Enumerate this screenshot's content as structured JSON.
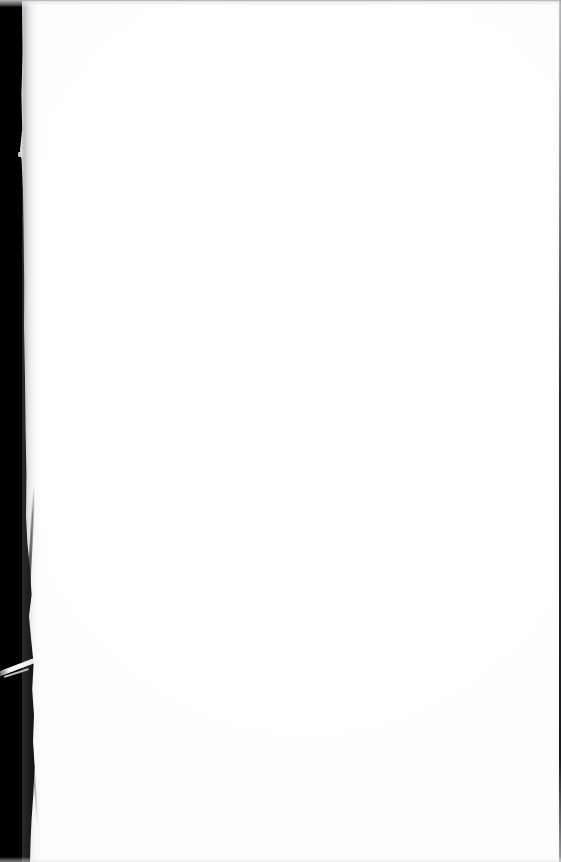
{
  "document": {
    "kind": "scanned-page-image",
    "page_condition": "blank",
    "visible_text": "",
    "body_text_lines": [],
    "page_number_label": "",
    "header_text": "",
    "footer_text": "",
    "caption": "",
    "annotations": []
  },
  "canvas": {
    "width_px": 561,
    "height_px": 862,
    "background_color": "#ffffff"
  },
  "artifacts": {
    "left_gutter": {
      "name": "scanner-gutter-band",
      "color": "#000000",
      "approx_width_px_top": 22,
      "approx_width_px_bottom": 31,
      "edge": "irregular-torn",
      "label": ""
    },
    "top_edge": {
      "name": "page-top-edge",
      "color": "#aaaeb3",
      "thickness_px": 1,
      "label": ""
    },
    "right_edge": {
      "name": "page-right-edge",
      "color": "#191b1e",
      "thickness_px": 2,
      "label": ""
    },
    "bottom_edge": {
      "name": "page-bottom-edge",
      "color": "#e2e4e7",
      "thickness_px": 1,
      "label": ""
    },
    "paper_tear": {
      "name": "torn-paper-fibre",
      "color": "#ffffff",
      "position_y_px": 672,
      "label": ""
    },
    "specks": [
      {
        "x_px": 290,
        "y_px": 88,
        "label": ""
      },
      {
        "x_px": 358,
        "y_px": 436,
        "label": ""
      },
      {
        "x_px": 368,
        "y_px": 482,
        "label": ""
      }
    ]
  }
}
